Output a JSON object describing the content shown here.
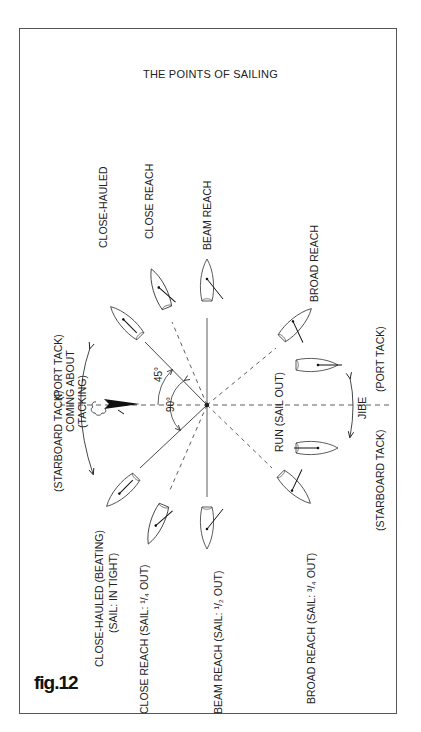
{
  "title": "THE POINTS OF SAILING",
  "figure_label": "fig.12",
  "colors": {
    "ink": "#222222",
    "frame": "#555555",
    "background": "#ffffff"
  },
  "wind": {
    "icon": "wind-cloud-arrow-icon",
    "angle_labels": {
      "close_hauled": "45°",
      "beam": "90°"
    }
  },
  "tacking": {
    "label_line1": "COMING ABOUT",
    "label_line2": "(TACKING)",
    "starboard": "(STARBOARD TACK)",
    "port": "(PORT TACK)",
    "divider": "|"
  },
  "jibing": {
    "label": "JIBE",
    "starboard": "(STARBOARD TACK)",
    "port": "(PORT TACK)"
  },
  "port_side_labels": {
    "close_hauled": "CLOSE-HAULED",
    "close_reach": "CLOSE REACH",
    "beam_reach": "BEAM REACH",
    "broad_reach": "BROAD REACH"
  },
  "starboard_side_labels": {
    "close_hauled_line1": "CLOSE-HAULED (BEATING)",
    "close_hauled_line2": "(SAIL: IN TIGHT)",
    "close_reach": "CLOSE REACH (SAIL: ¹/₄ OUT)",
    "beam_reach": "BEAM REACH (SAIL: ¹/₂ OUT)",
    "broad_reach": "BROAD REACH (SAIL: ³/₄ OUT)"
  },
  "run": {
    "label": "RUN (SAIL OUT)"
  },
  "points_of_sailing": [
    {
      "name": "Close-hauled",
      "angle_from_wind_deg": 45,
      "sail": "in tight"
    },
    {
      "name": "Close reach",
      "angle_from_wind_deg": 60,
      "sail": "1/4 out"
    },
    {
      "name": "Beam reach",
      "angle_from_wind_deg": 90,
      "sail": "1/2 out"
    },
    {
      "name": "Broad reach",
      "angle_from_wind_deg": 135,
      "sail": "3/4 out"
    },
    {
      "name": "Run",
      "angle_from_wind_deg": 180,
      "sail": "out"
    }
  ]
}
